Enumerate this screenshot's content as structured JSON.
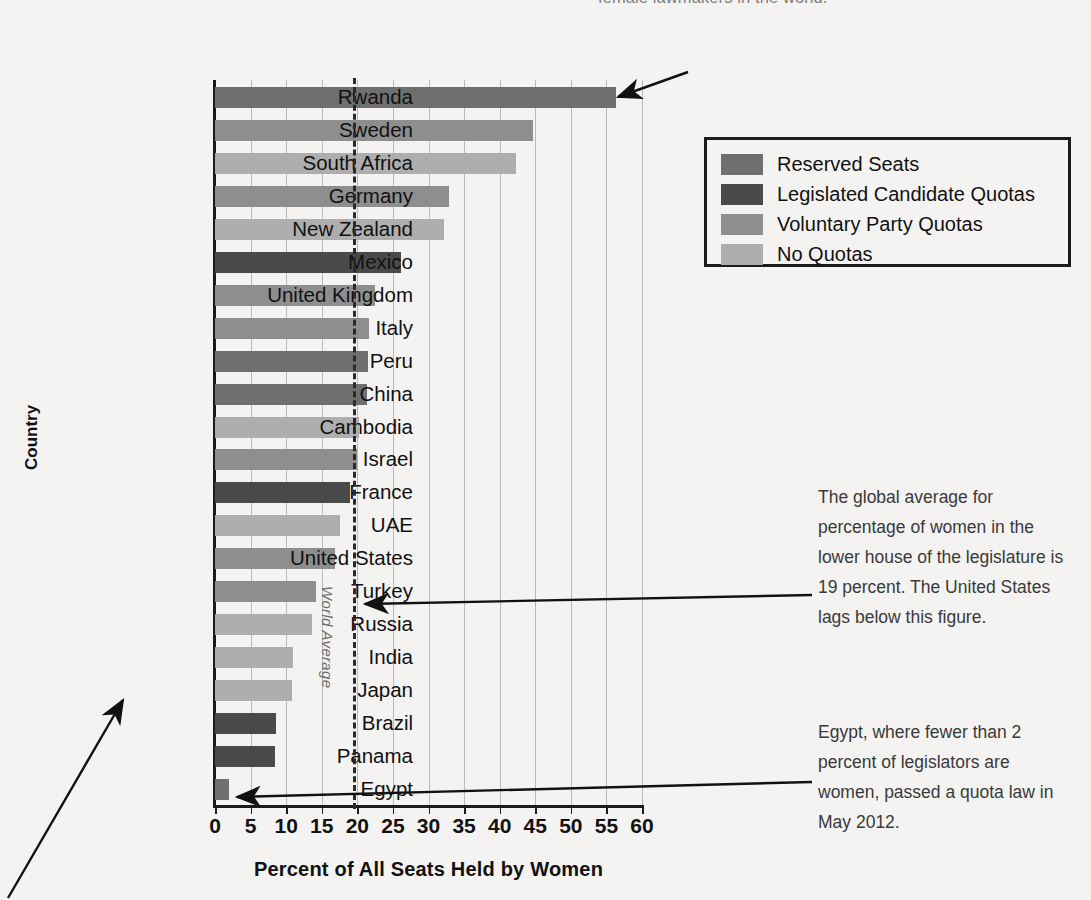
{
  "top_annotation": "female lawmakers in the world.",
  "axes": {
    "ylabel": "Country",
    "xlabel": "Percent of All Seats Held by Women",
    "xticks": [
      "0",
      "5",
      "10",
      "15",
      "20",
      "25",
      "30",
      "35",
      "40",
      "45",
      "50",
      "55",
      "60"
    ]
  },
  "world_average": {
    "label": "World Average",
    "value": 19
  },
  "legend": {
    "items": [
      {
        "label": "Reserved Seats",
        "color": "#6f6f6f"
      },
      {
        "label": "Legislated Candidate Quotas",
        "color": "#4a4a4a"
      },
      {
        "label": "Voluntary Party Quotas",
        "color": "#8e8e8e"
      },
      {
        "label": "No Quotas",
        "color": "#aeaeae"
      }
    ]
  },
  "notes": {
    "global_average": "The global average for percentage of women in the lower house of the legislature is 19 percent. The United States lags below this figure.",
    "egypt": "Egypt, where fewer than 2 percent of legislators are women, passed a quota law in May 2012."
  },
  "chart_data": {
    "type": "bar",
    "orientation": "horizontal",
    "title": "",
    "xlabel": "Percent of All Seats Held by Women",
    "ylabel": "Country",
    "xlim": [
      0,
      60
    ],
    "xticks": [
      0,
      5,
      10,
      15,
      20,
      25,
      30,
      35,
      40,
      45,
      50,
      55,
      60
    ],
    "grid": "vertical",
    "legend_position": "top-right",
    "reference_line": {
      "label": "World Average",
      "value": 19
    },
    "categories": [
      "Rwanda",
      "Sweden",
      "South Africa",
      "Germany",
      "New Zealand",
      "Mexico",
      "United Kingdom",
      "Italy",
      "Peru",
      "China",
      "Cambodia",
      "Israel",
      "France",
      "UAE",
      "United States",
      "Turkey",
      "Russia",
      "India",
      "Japan",
      "Brazil",
      "Panama",
      "Egypt"
    ],
    "values": [
      56.3,
      44.7,
      42.3,
      32.9,
      32.2,
      26.2,
      22.5,
      21.6,
      21.5,
      21.3,
      20.3,
      20.0,
      18.9,
      17.5,
      16.8,
      14.2,
      13.6,
      11.0,
      10.8,
      8.6,
      8.5,
      2.0
    ],
    "categories_quota_type": [
      "Reserved Seats",
      "Voluntary Party Quotas",
      "No Quotas",
      "Voluntary Party Quotas",
      "No Quotas",
      "Legislated Candidate Quotas",
      "Voluntary Party Quotas",
      "Voluntary Party Quotas",
      "Reserved Seats",
      "Reserved Seats",
      "No Quotas",
      "Voluntary Party Quotas",
      "Legislated Candidate Quotas",
      "No Quotas",
      "Voluntary Party Quotas",
      "Voluntary Party Quotas",
      "No Quotas",
      "No Quotas",
      "No Quotas",
      "Legislated Candidate Quotas",
      "Legislated Candidate Quotas",
      "Reserved Seats"
    ],
    "colors": {
      "Reserved Seats": "#6f6f6f",
      "Legislated Candidate Quotas": "#4a4a4a",
      "Voluntary Party Quotas": "#8e8e8e",
      "No Quotas": "#aeaeae"
    }
  }
}
